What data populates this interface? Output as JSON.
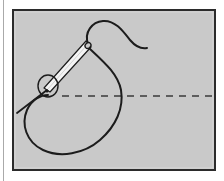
{
  "figure": {
    "title": "Sewing needle drawing thread through fabric",
    "caption_visible": false,
    "type": "line-illustration",
    "domain": "instructional-diagram"
  },
  "page": {
    "background_color": "#ffffff",
    "margin_rule": {
      "name": "left-margin-rule",
      "x": 3.5,
      "y_start": 0,
      "y_end": 181,
      "color": "#aaaaaa",
      "width": 1
    }
  },
  "panel": {
    "name": "illustration-frame",
    "x": 12,
    "y": 9,
    "width": 204,
    "height": 162,
    "fill_color": "#c9c9c9",
    "border_color": "#2b2b2b",
    "border_width": 2,
    "inner_highlight_color": "#d6d6d6"
  },
  "elements": {
    "fabric_line": {
      "label": "fabric-stitch-line",
      "style": "dashed",
      "color": "#3a3a3a",
      "stroke_width": 1.6,
      "dash_pattern": "7 6",
      "y": 96,
      "x_start": 62,
      "x_end": 214
    },
    "thread_loop": {
      "label": "thread-loop",
      "color": "#1c1c1c",
      "stroke_width": 2.0,
      "description": "Large looping thread descending from the needle eye, curving down and around to the left then back up"
    },
    "thread_tail": {
      "label": "thread-tail",
      "color": "#1c1c1c",
      "stroke_width": 2.0,
      "description": "Free end of thread rising over the top and trailing off to the right"
    },
    "needle": {
      "label": "sewing-needle",
      "body_fill": "#f4f4f4",
      "outline_color": "#1c1c1c",
      "outline_width": 1.2,
      "angle_description": "Oriented from lower-left to upper-right",
      "eye_position": {
        "x": 88,
        "y": 46
      },
      "tip_position": {
        "x": 17,
        "y": 113
      }
    },
    "detail_circle": {
      "label": "insertion-point-circle",
      "color": "#1c1c1c",
      "stroke_width": 1.4,
      "cx": 48,
      "cy": 86,
      "rx": 10,
      "ry": 11
    },
    "entry_dot": {
      "label": "needle-entry-dot",
      "color": "#1c1c1c",
      "cx": 47,
      "cy": 91,
      "r": 1.6
    }
  },
  "colors": {
    "ink": "#1c1c1c",
    "panel_gray": "#c9c9c9",
    "frame": "#2b2b2b",
    "paper": "#ffffff",
    "needle_metal": "#f4f4f4"
  }
}
